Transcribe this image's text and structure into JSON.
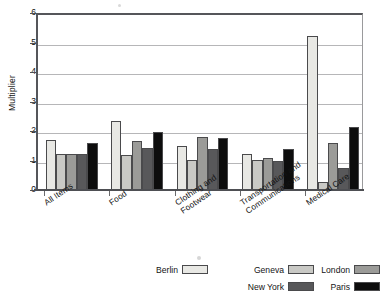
{
  "chart_data": {
    "type": "bar",
    "title": "",
    "subtitle": "",
    "xlabel": "",
    "ylabel": "Multiplier",
    "ylim": [
      0,
      6
    ],
    "yticks": [
      "0",
      "1",
      "2",
      "3",
      "4",
      "5",
      "6"
    ],
    "grid": true,
    "legend_position": "bottom",
    "categories": [
      "All Items",
      "Food",
      "Clothing and\nFootwear",
      "Transportation and\nCommunications",
      "Medical Care"
    ],
    "series": [
      {
        "name": "Berlin",
        "color": "#e8e8e4",
        "values": [
          1.7,
          2.35,
          1.48,
          1.23,
          5.22
        ]
      },
      {
        "name": "Geneva",
        "color": "#c9c9c5",
        "values": [
          1.21,
          1.19,
          1.03,
          1.02,
          0.28
        ]
      },
      {
        "name": "London",
        "color": "#9b9b98",
        "values": [
          1.21,
          1.65,
          1.8,
          1.07,
          1.58
        ]
      },
      {
        "name": "New York",
        "color": "#58585a",
        "values": [
          1.21,
          1.42,
          1.4,
          1.0,
          0.73
        ]
      },
      {
        "name": "Paris",
        "color": "#0d0d0d",
        "values": [
          1.6,
          1.97,
          1.78,
          1.38,
          2.13
        ]
      }
    ],
    "legend_rows": [
      [
        "Berlin",
        "Geneva",
        "London"
      ],
      [
        "New York",
        "Paris"
      ]
    ]
  }
}
